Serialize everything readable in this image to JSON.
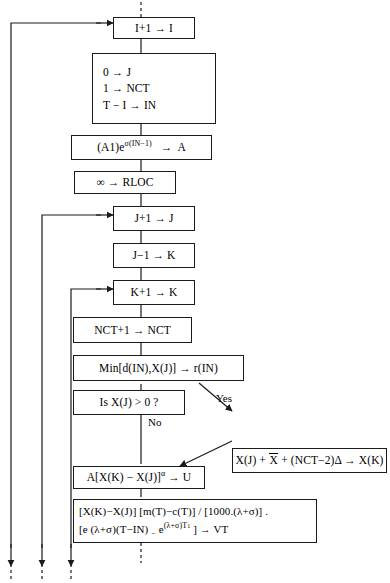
{
  "diagram": {
    "type": "flowchart",
    "canvas": {
      "width": 390,
      "height": 583
    },
    "style": {
      "stroke": "#1a1a1a",
      "fill": "#ffffff",
      "text": "#000000"
    }
  },
  "nodes": [
    {
      "id": "n1",
      "name": "increment-i",
      "lines": [
        "I+1  →  I"
      ],
      "shape": "process"
    },
    {
      "id": "n2",
      "name": "initialize-j-nct-in",
      "lines": [
        "0  →  J",
        "1  →  NCT",
        "T − I  →  IN"
      ],
      "shape": "process"
    },
    {
      "id": "n3",
      "name": "compute-a",
      "lines": [
        "(A1)eσ(IN−1)  →  A"
      ],
      "shape": "process"
    },
    {
      "id": "n4",
      "name": "set-rloc-infinity",
      "lines": [
        "∞  →  RLOC"
      ],
      "shape": "process"
    },
    {
      "id": "n5",
      "name": "increment-j",
      "lines": [
        "J+1  →  J"
      ],
      "shape": "process"
    },
    {
      "id": "n6",
      "name": "set-k-from-j",
      "lines": [
        "J−1  →  K"
      ],
      "shape": "process"
    },
    {
      "id": "n7",
      "name": "increment-k",
      "lines": [
        "K+1  →  K"
      ],
      "shape": "process"
    },
    {
      "id": "n8",
      "name": "increment-nct",
      "lines": [
        "NCT+1  →  NCT"
      ],
      "shape": "process"
    },
    {
      "id": "n9",
      "name": "compute-min-r-in",
      "lines": [
        "Min[d(IN),X(J)]  →  r(IN)"
      ],
      "shape": "process"
    },
    {
      "id": "n10",
      "name": "decision-x-j-positive",
      "lines": [
        "Is  X(J) > 0 ?"
      ],
      "shape": "decision"
    },
    {
      "id": "n11",
      "name": "compute-x-k",
      "lines": [
        "X(J) + X̄ + (NCT−2)Δ → X(K)"
      ],
      "shape": "process"
    },
    {
      "id": "n12",
      "name": "compute-u",
      "lines": [
        "A[X(K) − X(J)]α → U"
      ],
      "shape": "process"
    },
    {
      "id": "n13",
      "name": "compute-vt",
      "lines": [
        "[X(K)−X(J)] [m(T)−c(T)] / [1000.(λ+σ)] .",
        "[e (λ+σ)(T−IN) − e(λ+σ)T¹ ] → VT"
      ],
      "shape": "process"
    }
  ],
  "edge_labels": {
    "yes": "Yes",
    "no": "No"
  },
  "loops": [
    {
      "name": "outer-loop-to-increment-i",
      "target": "n1"
    },
    {
      "name": "loop-to-increment-j",
      "target": "n5"
    },
    {
      "name": "loop-to-increment-k",
      "target": "n7"
    }
  ]
}
